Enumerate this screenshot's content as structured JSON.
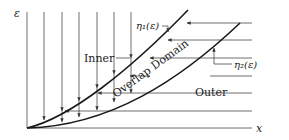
{
  "figure": {
    "axes": {
      "y_label": "ε",
      "x_label": "x"
    },
    "curves": [
      {
        "id": "eta1",
        "label": "η₁(ε)",
        "description": "inner limit curve"
      },
      {
        "id": "eta2",
        "label": "η₂(ε)",
        "description": "outer limit curve"
      }
    ],
    "regions": {
      "inner": "Inner",
      "overlap": "Overlap Domain",
      "outer": "Outer"
    },
    "colors": {
      "line": "#4a4a4a",
      "curve": "#1a1a1a",
      "background": "#ffffff"
    }
  }
}
